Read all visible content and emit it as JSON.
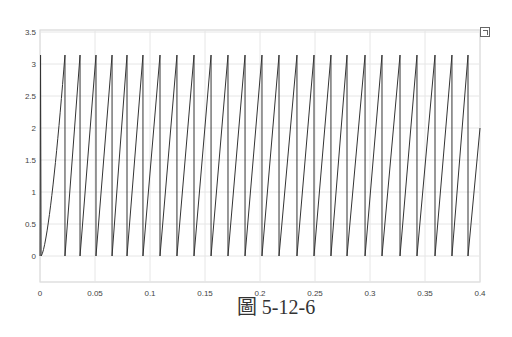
{
  "caption": "圖 5-12-6",
  "expand_icon": "expand-axes-icon",
  "colors": {
    "line": "#333333",
    "grid": "#e6e6e6",
    "axis": "#cfcfcf",
    "text": "#444444"
  },
  "chart_data": {
    "type": "line",
    "title": "",
    "xlabel": "",
    "ylabel": "",
    "xlim": [
      0,
      0.4
    ],
    "ylim": [
      -0.4,
      3.55
    ],
    "grid": true,
    "legend": null,
    "xticks": [
      0,
      0.05,
      0.1,
      0.15,
      0.2,
      0.25,
      0.3,
      0.35,
      0.4
    ],
    "xtick_labels": [
      "0",
      "0.05",
      "0.1",
      "0.15",
      "0.2",
      "0.25",
      "0.3",
      "0.35",
      "0.4"
    ],
    "yticks": [
      0,
      0.5,
      1,
      1.5,
      2,
      2.5,
      3,
      3.5
    ],
    "ytick_labels": [
      "0",
      "0.5",
      "1",
      "1.5",
      "2",
      "2.5",
      "3",
      "3.5"
    ],
    "series": [
      {
        "name": "signal",
        "peak_value": 3.14,
        "reset_times": [
          0.0227,
          0.0364,
          0.0509,
          0.0655,
          0.0791,
          0.0936,
          0.1091,
          0.1245,
          0.14,
          0.1555,
          0.1709,
          0.1864,
          0.2018,
          0.2173,
          0.2336,
          0.2491,
          0.2645,
          0.2791,
          0.2955,
          0.3109,
          0.3273,
          0.3427,
          0.3591,
          0.3745,
          0.3891
        ],
        "final_value": 2.0
      }
    ]
  }
}
